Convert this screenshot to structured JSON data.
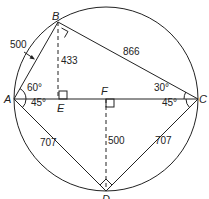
{
  "diagram": {
    "type": "geometry",
    "points": {
      "A": {
        "label": "A"
      },
      "B": {
        "label": "B"
      },
      "C": {
        "label": "C"
      },
      "D": {
        "label": "D"
      },
      "E": {
        "label": "E"
      },
      "F": {
        "label": "F"
      }
    },
    "lengths": {
      "AB": "500",
      "BC": "866",
      "BE": "433",
      "AD": "707",
      "CD": "707",
      "FD": "500"
    },
    "angles": {
      "BAC": "60°",
      "CAD": "45°",
      "ACB": "30°",
      "ACD": "45°"
    },
    "right_angles": [
      "B",
      "D",
      "E",
      "F"
    ],
    "colors": {
      "stroke": "#222222",
      "background": "#ffffff"
    }
  }
}
